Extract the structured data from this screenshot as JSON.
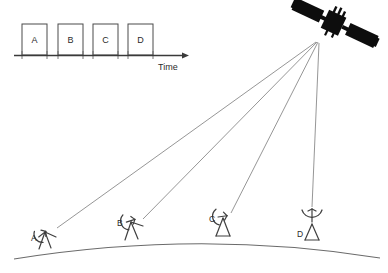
{
  "figure": {
    "background_color": "#ffffff",
    "line_color": "#8a8a8a",
    "ink_color": "#2b2b2b",
    "satellite_color": "#0d0d0d"
  },
  "timeline": {
    "axis_label": "Time",
    "slots": [
      {
        "label": "A",
        "x": 22,
        "y": 24,
        "w": 25,
        "h": 31
      },
      {
        "label": "B",
        "x": 58,
        "y": 24,
        "w": 25,
        "h": 31
      },
      {
        "label": "C",
        "x": 93,
        "y": 24,
        "w": 25,
        "h": 31
      },
      {
        "label": "D",
        "x": 128,
        "y": 24,
        "w": 25,
        "h": 31
      }
    ],
    "axis": {
      "x1": 14,
      "x2": 186,
      "y": 55
    }
  },
  "satellite": {
    "name": "satellite",
    "center_x": 334,
    "center_y": 23
  },
  "beam_origin": {
    "x": 317,
    "y": 42
  },
  "ground_stations": [
    {
      "label": "A",
      "x": 45,
      "y": 232,
      "label_x": 31,
      "label_y": 240,
      "dish_rotation": -38
    },
    {
      "label": "B",
      "x": 131,
      "y": 222,
      "label_x": 118,
      "label_y": 226,
      "dish_rotation": -22
    },
    {
      "label": "C",
      "x": 223,
      "y": 218,
      "label_x": 210,
      "label_y": 222,
      "dish_rotation": -10
    },
    {
      "label": "D",
      "x": 312,
      "y": 225,
      "label_x": 300,
      "label_y": 236,
      "dish_rotation": 0
    }
  ],
  "beams": [
    {
      "from": "satellite",
      "to": "A"
    },
    {
      "from": "satellite",
      "to": "B"
    },
    {
      "from": "satellite",
      "to": "C"
    },
    {
      "from": "satellite",
      "to": "D"
    }
  ],
  "earth_arc": {
    "left_x": 14,
    "left_y": 259,
    "peak_x": 212,
    "peak_y": 236,
    "right_x": 380,
    "right_y": 258
  }
}
